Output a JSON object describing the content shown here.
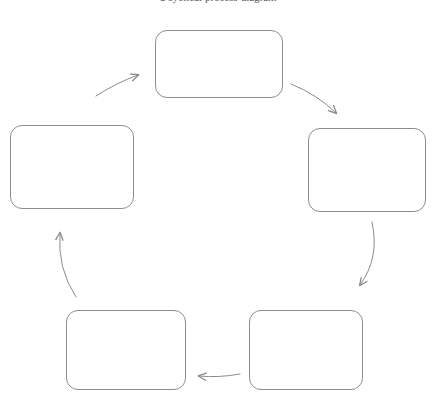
{
  "figure": {
    "caption_fragment": "a cyclical process diagram",
    "background_color": "#ffffff",
    "box_border_color": "#8d8d8d",
    "arrow_color": "#8a8a8a",
    "box_fill_color": "#ffffff",
    "width": 437,
    "height": 405
  },
  "nodes": [
    {
      "id": "node-top",
      "label": "",
      "x": 155,
      "y": 30,
      "w": 128,
      "h": 68
    },
    {
      "id": "node-right",
      "label": "",
      "x": 308,
      "y": 128,
      "w": 118,
      "h": 84
    },
    {
      "id": "node-bottom-right",
      "label": "",
      "x": 249,
      "y": 310,
      "w": 114,
      "h": 80
    },
    {
      "id": "node-bottom-left",
      "label": "",
      "x": 66,
      "y": 310,
      "w": 120,
      "h": 80
    },
    {
      "id": "node-left",
      "label": "",
      "x": 10,
      "y": 125,
      "w": 124,
      "h": 84
    }
  ],
  "arrows": [
    {
      "id": "arrow-top-to-right",
      "from": "node-top",
      "to": "node-right",
      "direction": "down-right"
    },
    {
      "id": "arrow-right-to-bottom-right",
      "from": "node-right",
      "to": "node-bottom-right",
      "direction": "down"
    },
    {
      "id": "arrow-bottom-right-to-bottom-left",
      "from": "node-bottom-right",
      "to": "node-bottom-left",
      "direction": "left"
    },
    {
      "id": "arrow-bottom-left-to-left",
      "from": "node-bottom-left",
      "to": "node-left",
      "direction": "up"
    },
    {
      "id": "arrow-left-to-top",
      "from": "node-left",
      "to": "node-top",
      "direction": "up-right"
    }
  ]
}
